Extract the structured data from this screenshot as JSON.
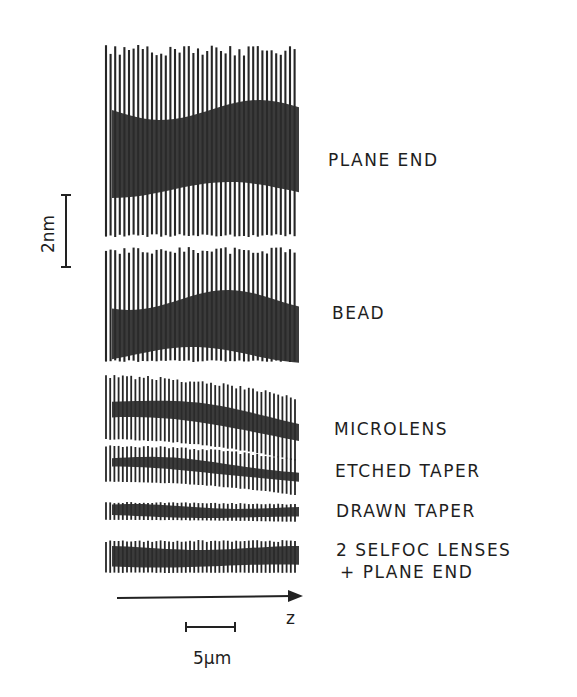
{
  "figure": {
    "scale_bar_vertical": {
      "label": "2nm"
    },
    "scale_bar_horizontal": {
      "label": "5µm"
    },
    "axis": {
      "label": "z"
    },
    "traces": [
      {
        "label": "PLANE END",
        "top": 45,
        "bottom": 237,
        "dense_top": 110,
        "dense_bottom": 190,
        "slope": 0
      },
      {
        "label": "BEAD",
        "top": 247,
        "bottom": 362,
        "dense_top": 300,
        "dense_bottom": 355,
        "slope": 0
      },
      {
        "label": "MICROLENS",
        "top": 375,
        "bottom": 440,
        "dense_top": 400,
        "dense_bottom": 418,
        "slope": 22
      },
      {
        "label": "ETCHED TAPER",
        "top": 445,
        "bottom": 482,
        "dense_top": 458,
        "dense_bottom": 468,
        "slope": 14
      },
      {
        "label": "DRAWN TAPER",
        "top": 502,
        "bottom": 520,
        "dense_top": 506,
        "dense_bottom": 516,
        "slope": 2
      },
      {
        "label": "2 SELFOC LENSES",
        "label_line2": "+ PLANE END",
        "top": 540,
        "bottom": 573,
        "dense_top": 548,
        "dense_bottom": 566,
        "slope": 0
      }
    ]
  },
  "chart_data": {
    "type": "diagram",
    "title": "",
    "traces": [
      "PLANE END",
      "BEAD",
      "MICROLENS",
      "ETCHED TAPER",
      "DRAWN TAPER",
      "2 SELFOC LENSES + PLANE END"
    ],
    "relative_amplitude": [
      1.0,
      0.6,
      0.33,
      0.19,
      0.09,
      0.17
    ],
    "vertical_scale": "2nm",
    "horizontal_scale": "5µm",
    "xlabel": "z"
  }
}
